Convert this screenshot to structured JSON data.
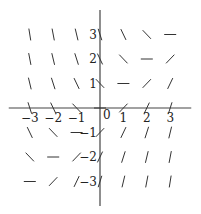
{
  "chart_data": {
    "type": "slope-field",
    "title": "",
    "equation": "dy/dx = x - y",
    "xlabel": "",
    "ylabel": "",
    "xlim": [
      -3.9,
      3.9
    ],
    "ylim": [
      -4,
      4
    ],
    "grid": false,
    "x_ticks": [
      -3,
      -2,
      -1,
      1,
      2,
      3
    ],
    "y_ticks": [
      -3,
      -2,
      -1,
      1,
      2,
      3
    ],
    "x_tick_labels": [
      "-3",
      "-2",
      "-1",
      "1",
      "2",
      "3"
    ],
    "y_tick_labels": [
      "-3",
      "-2",
      "-1",
      "1",
      "2",
      "3"
    ],
    "origin_label": "0",
    "x_points": [
      -3,
      -2,
      -1,
      0,
      1,
      2,
      3
    ],
    "y_points": [
      -3,
      -2,
      -1,
      0,
      1,
      2,
      3
    ],
    "slope_rule": "slope = x - y"
  },
  "colors": {
    "axis": "#444444",
    "segment": "#333333",
    "text": "#222222"
  },
  "layout": {
    "origin_px": [
      100,
      108
    ],
    "unit_px_x": 23.4,
    "unit_px_y": 24.5,
    "segment_half_len": 6
  }
}
